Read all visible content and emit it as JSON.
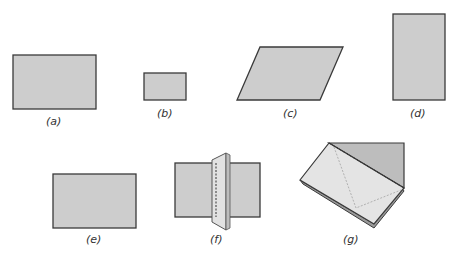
{
  "figure": {
    "colors": {
      "fill": "#cdcdcd",
      "stroke": "#3a3a3a",
      "light_fill": "#e6e6e6",
      "dark_fill": "#b9b9b9"
    },
    "panels": [
      {
        "id": "a",
        "label": "(a)",
        "shape": "rectangle"
      },
      {
        "id": "b",
        "label": "(b)",
        "shape": "small rectangle"
      },
      {
        "id": "c",
        "label": "(c)",
        "shape": "parallelogram"
      },
      {
        "id": "d",
        "label": "(d)",
        "shape": "tall rectangle"
      },
      {
        "id": "e",
        "label": "(e)",
        "shape": "rectangle"
      },
      {
        "id": "f",
        "label": "(f)",
        "shape": "rectangle with folded strip"
      },
      {
        "id": "g",
        "label": "(g)",
        "shape": "folded paper pentagon"
      }
    ]
  }
}
